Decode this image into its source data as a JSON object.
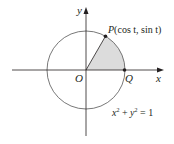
{
  "figure": {
    "type": "unit-circle-sector",
    "equation": {
      "x_var": "x",
      "x_exp": "2",
      "plus": " + ",
      "y_var": "y",
      "y_exp": "2",
      "equals": " = 1"
    },
    "axes": {
      "x_label": "x",
      "y_label": "y"
    },
    "points": {
      "origin": {
        "label": "O"
      },
      "P": {
        "label_name": "P",
        "label_coords": "(cos t, sin t)",
        "angle_deg": 60
      },
      "Q": {
        "label": "Q"
      }
    },
    "colors": {
      "stroke": "#231f20",
      "sector_fill": "#dcdcdc",
      "circle_stroke": "#555555"
    },
    "geometry": {
      "center_x": 86,
      "center_y": 70,
      "radius": 39
    }
  }
}
